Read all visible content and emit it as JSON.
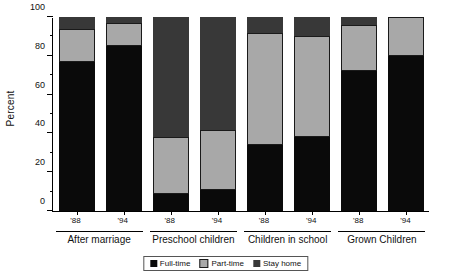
{
  "chart_data": {
    "type": "bar",
    "subtype": "stacked-bar-100-percent",
    "title": "",
    "xlabel": "",
    "ylabel": "Percent",
    "ylim": [
      0,
      100
    ],
    "yticks": [
      0,
      20,
      40,
      60,
      80,
      100
    ],
    "ytick_labels": [
      "0",
      "20",
      "40",
      "60",
      "80",
      "100"
    ],
    "grid": false,
    "legend_position": "bottom-center",
    "categories": [
      "'88",
      "'94",
      "'88",
      "'94",
      "'88",
      "'94",
      "'88",
      "'94"
    ],
    "groups": [
      {
        "label": "After marriage",
        "members": [
          "'88",
          "'94"
        ]
      },
      {
        "label": "Preschool children",
        "members": [
          "'88",
          "'94"
        ]
      },
      {
        "label": "Children in school",
        "members": [
          "'88",
          "'94"
        ]
      },
      {
        "label": "Grown Children",
        "members": [
          "'88",
          "'94"
        ]
      }
    ],
    "series": [
      {
        "name": "Full-time",
        "color": "#0a0a0a",
        "values": [
          77,
          85,
          9,
          11,
          34,
          38,
          72,
          80
        ]
      },
      {
        "name": "Part-time",
        "color": "#a8a8a8",
        "values": [
          17,
          12,
          29,
          31,
          58,
          52,
          24,
          20
        ]
      },
      {
        "name": "Stay home",
        "color": "#383838",
        "values": [
          6,
          3,
          62,
          58,
          8,
          10,
          4,
          0
        ]
      }
    ],
    "bars": [
      {
        "tick": "'88",
        "group": "After marriage",
        "full_time": 77,
        "part_time": 17,
        "stay_home": 6
      },
      {
        "tick": "'94",
        "group": "After marriage",
        "full_time": 85,
        "part_time": 12,
        "stay_home": 3
      },
      {
        "tick": "'88",
        "group": "Preschool children",
        "full_time": 9,
        "part_time": 29,
        "stay_home": 62
      },
      {
        "tick": "'94",
        "group": "Preschool children",
        "full_time": 11,
        "part_time": 31,
        "stay_home": 58
      },
      {
        "tick": "'88",
        "group": "Children in school",
        "full_time": 34,
        "part_time": 58,
        "stay_home": 8
      },
      {
        "tick": "'94",
        "group": "Children in school",
        "full_time": 38,
        "part_time": 52,
        "stay_home": 10
      },
      {
        "tick": "'88",
        "group": "Grown Children",
        "full_time": 72,
        "part_time": 24,
        "stay_home": 4
      },
      {
        "tick": "'94",
        "group": "Grown Children",
        "full_time": 80,
        "part_time": 20,
        "stay_home": 0
      }
    ]
  },
  "axis": {
    "y_title": "Percent",
    "y_labels": [
      "100",
      "80",
      "60",
      "40",
      "20",
      "0"
    ]
  },
  "legend": {
    "items": [
      {
        "label": "Full-time",
        "swatch": "legend-swatch-full-time"
      },
      {
        "label": "Part-time",
        "swatch": "legend-swatch-part-time"
      },
      {
        "label": "Stay home",
        "swatch": "legend-swatch-stay-home"
      }
    ]
  },
  "tick_labels": {
    "b0": "'88",
    "b1": "'94",
    "b2": "'88",
    "b3": "'94",
    "b4": "'88",
    "b5": "'94",
    "b6": "'88",
    "b7": "'94"
  },
  "group_labels": {
    "g0": "After marriage",
    "g1": "Preschool children",
    "g2": "Children in school",
    "g3": "Grown Children"
  }
}
